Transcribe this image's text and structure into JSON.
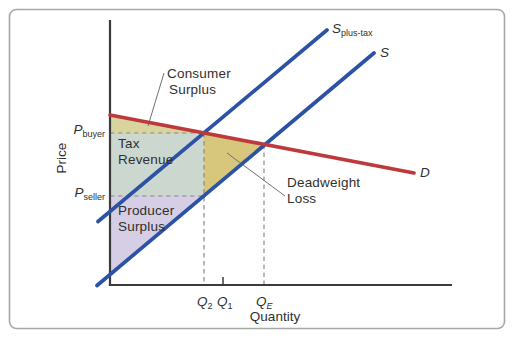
{
  "figure": {
    "axis": {
      "y_label": "Price",
      "x_label": "Quantity"
    },
    "curves": {
      "s_plus_tax": {
        "symbol": "S",
        "subscript": "plus-tax"
      },
      "s": {
        "symbol": "S"
      },
      "d": {
        "symbol": "D"
      }
    },
    "prices": {
      "p_buyer": {
        "symbol": "P",
        "subscript": "buyer"
      },
      "p_seller": {
        "symbol": "P",
        "subscript": "seller"
      }
    },
    "quantities": {
      "q2": {
        "symbol": "Q",
        "subscript": "2"
      },
      "q1": {
        "symbol": "Q",
        "subscript": "1"
      },
      "qe": {
        "symbol": "Q",
        "subscript": "E"
      }
    },
    "regions": {
      "consumer_surplus": {
        "line1": "Consumer",
        "line2": "Surplus",
        "color": "#d9d39e"
      },
      "tax_revenue": {
        "line1": "Tax",
        "line2": "Revenue",
        "color": "#ccd8cf"
      },
      "deadweight_loss": {
        "line1": "Deadweight",
        "line2": "Loss",
        "color": "#d6c77c"
      },
      "producer_surplus": {
        "line1": "Producer",
        "line2": "Surplus",
        "color": "#d6cee4"
      }
    },
    "colors": {
      "supply_line": "#2b52a4",
      "demand_line": "#be393c",
      "axis_line": "#3b3b3b",
      "dashed_line": "#8a8a8a",
      "leader_line": "#707070",
      "frame_border": "#a6a9a2",
      "text": "#2f2f2f"
    }
  }
}
